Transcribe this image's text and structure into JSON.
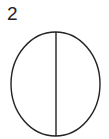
{
  "figure": {
    "label": "2",
    "shape": "ellipse-divided-vertically",
    "stroke_color": "#222222",
    "background": "#ffffff"
  }
}
